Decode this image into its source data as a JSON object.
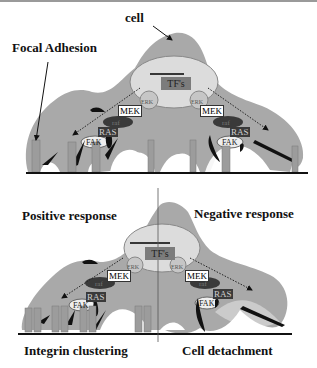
{
  "labels": {
    "cell": "cell",
    "focal_adhesion": "Focal Adhesion",
    "positive_response": "Positive response",
    "negative_response": "Negative response",
    "integrin_clustering": "Integrin clustering",
    "cell_detachment": "Cell detachment"
  },
  "panel_top": {
    "nucleus_label": "TF's",
    "left": {
      "erk": "ERK",
      "mek": "MEK",
      "raf": "raf",
      "ras": "RAS",
      "fak": "FAK"
    },
    "right": {
      "erk": "ERK",
      "mek": "MEK",
      "raf": "raf",
      "ras": "RAS",
      "fak": "FAK"
    }
  },
  "panel_bottom": {
    "nucleus_label": "TF's",
    "left": {
      "erk": "ERK",
      "mek": "MEK",
      "raf": "raf",
      "ras": "RAS",
      "fak": "FAK"
    },
    "right": {
      "erk": "ERK",
      "mek": "MEK",
      "raf": "raf",
      "ras": "RAS",
      "fak": "FAK"
    }
  },
  "colors": {
    "cell_fill": "#a9a9a9",
    "nucleus_fill": "#dcdcdc",
    "integrin_fill": "#9c9c9c",
    "dark": "#1a1a1a"
  }
}
